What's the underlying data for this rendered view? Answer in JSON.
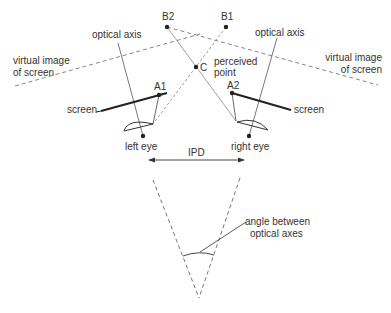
{
  "diagram": {
    "points": {
      "B1": "B1",
      "B2": "B2",
      "C": "C",
      "A1": "A1",
      "A2": "A2"
    },
    "labels": {
      "optical_axis_left": "optical axis",
      "optical_axis_right": "optical axis",
      "virtual_image_left_1": "virtual image",
      "virtual_image_left_2": "of screen",
      "virtual_image_right_1": "virtual image",
      "virtual_image_right_2": "of screen",
      "perceived_point_1": "perceived",
      "perceived_point_2": "point",
      "screen_left": "screen",
      "screen_right": "screen",
      "left_eye": "left eye",
      "right_eye": "right eye",
      "ipd": "IPD",
      "angle_1": "angle between",
      "angle_2": "optical axes"
    },
    "colors": {
      "line": "#333333",
      "thin_line": "#777777",
      "text": "#333333"
    }
  }
}
